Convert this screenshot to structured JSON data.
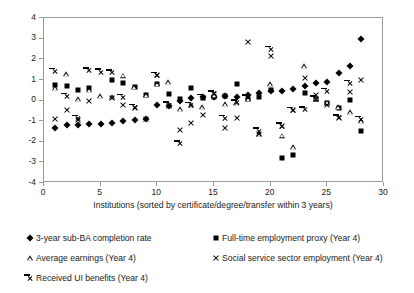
{
  "chart_data": {
    "type": "scatter",
    "title": "",
    "xlabel": "Institutions (sorted by certificate/degree/transfer within 3 years)",
    "ylabel": "",
    "xlim": [
      0,
      30
    ],
    "ylim": [
      -4,
      4
    ],
    "xticks": [
      0,
      5,
      10,
      15,
      20,
      25,
      30
    ],
    "yticks": [
      4,
      3,
      2,
      1,
      0,
      -1,
      -2,
      -3,
      -4
    ],
    "grid": false,
    "legend_position": "below-plot",
    "x": [
      1,
      2,
      3,
      4,
      5,
      6,
      7,
      8,
      9,
      10,
      11,
      12,
      13,
      14,
      15,
      16,
      17,
      18,
      19,
      20,
      21,
      22,
      23,
      24,
      25,
      26,
      27,
      28
    ],
    "series": [
      {
        "name": "3-year sub-BA completion rate",
        "marker": "diamond",
        "values": [
          -1.33,
          -1.19,
          -1.19,
          -1.16,
          -1.16,
          -1.11,
          -0.99,
          -0.96,
          -0.9,
          -0.22,
          -0.25,
          0.0,
          0.12,
          0.16,
          0.17,
          0.22,
          0.16,
          0.25,
          0.38,
          0.47,
          0.48,
          0.55,
          0.72,
          0.85,
          0.9,
          1.34,
          1.69,
          2.96
        ]
      },
      {
        "name": "Full-time employment proxy (Year 4)",
        "marker": "square",
        "values": [
          0.74,
          0.69,
          0.5,
          0.62,
          null,
          0.97,
          0.84,
          0.66,
          0.28,
          0.8,
          0.33,
          0.06,
          0.63,
          0.14,
          0.18,
          0.22,
          0.81,
          0.09,
          0.16,
          0.52,
          -2.81,
          -2.65,
          0.36,
          0.07,
          -0.11,
          -0.34,
          0.03,
          -1.48
        ]
      },
      {
        "name": "Average earnings (Year 4)",
        "marker": "triangle",
        "values": [
          0.59,
          1.27,
          0.07,
          0.52,
          0.23,
          0.16,
          1.21,
          0.66,
          0.26,
          0.78,
          0.91,
          -0.42,
          -0.24,
          -0.32,
          0.26,
          -0.17,
          -0.11,
          0.08,
          -1.62,
          0.8,
          -1.7,
          -2.25,
          1.68,
          0.09,
          -0.1,
          -0.31,
          -0.55,
          -1.0
        ]
      },
      {
        "name": "Social service sector employment (Year 4)",
        "marker": "cross",
        "values": [
          -0.88,
          -0.45,
          -0.93,
          0.0,
          null,
          0.14,
          -0.22,
          -0.35,
          -0.9,
          1.23,
          -0.28,
          -1.41,
          -1.1,
          -0.69,
          0.3,
          -1.35,
          -0.84,
          2.83,
          -1.6,
          2.17,
          -1.24,
          -0.45,
          1.07,
          0.25,
          -0.22,
          -0.85,
          0.4,
          1.01
        ]
      },
      {
        "name": "Received UI benefits (Year 4)",
        "marker": "star",
        "values": [
          1.41,
          0.21,
          -0.86,
          1.44,
          1.38,
          1.34,
          0.14,
          -0.33,
          null,
          1.21,
          -0.22,
          -2.1,
          -0.25,
          0.16,
          0.32,
          -0.86,
          -0.12,
          0.13,
          -1.48,
          2.49,
          -1.24,
          -0.47,
          -0.46,
          0.07,
          0.45,
          -0.84,
          0.84,
          -0.91
        ]
      }
    ]
  },
  "legend": {
    "items": [
      {
        "label": "3-year sub-BA completion rate",
        "marker": "diamond"
      },
      {
        "label": "Full-time employment proxy (Year 4)",
        "marker": "square"
      },
      {
        "label": "Average earnings (Year 4)",
        "marker": "triangle"
      },
      {
        "label": "Social service sector employment (Year 4)",
        "marker": "cross"
      },
      {
        "label": "Received UI benefits (Year 4)",
        "marker": "star"
      }
    ]
  },
  "axis": {
    "x_title": "Institutions (sorted by certificate/degree/transfer within 3 years)",
    "x_ticklabels": [
      "0",
      "5",
      "10",
      "15",
      "20",
      "25",
      "30"
    ],
    "y_ticklabels": [
      "4",
      "3",
      "2",
      "1",
      "0",
      "-1",
      "-2",
      "-3",
      "-4"
    ]
  },
  "colors": {
    "marker": "#000000",
    "frame": "#9a9a9a",
    "text": "#1a1a1a",
    "background": "#ffffff"
  }
}
